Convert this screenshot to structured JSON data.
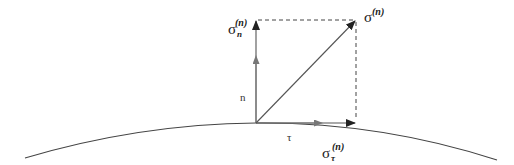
{
  "diagram": {
    "type": "stress-vector-decomposition",
    "colors": {
      "line": "#555555",
      "dark_line": "#222222",
      "light_line": "#777777",
      "curve": "#444444",
      "background": "#ffffff"
    },
    "labels": {
      "sigma_n": {
        "base": "σ",
        "sub": "n",
        "sup": "(n)"
      },
      "sigma": {
        "base": "σ",
        "sup": "(n)"
      },
      "sigma_tau": {
        "base": "σ",
        "sub": "τ",
        "sup": "(n)"
      },
      "normal_vector": "n",
      "tangent_vector": "τ"
    },
    "points": {
      "origin": [
        256,
        123
      ],
      "normal_tip": [
        256,
        20
      ],
      "resultant_tip": [
        356,
        20
      ],
      "tangential_tip": [
        356,
        123
      ]
    },
    "elements": [
      "surface-curve",
      "normal-unit-vector-n",
      "tangent-unit-vector-tau",
      "normal-stress-component",
      "tangential-stress-component",
      "resultant-stress-vector",
      "dashed-projection-lines"
    ]
  }
}
